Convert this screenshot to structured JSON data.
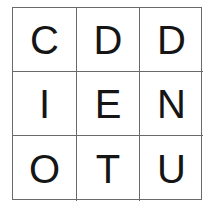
{
  "grid": {
    "rows": [
      [
        "C",
        "D",
        "D"
      ],
      [
        "I",
        "E",
        "N"
      ],
      [
        "O",
        "T",
        "U"
      ]
    ]
  }
}
